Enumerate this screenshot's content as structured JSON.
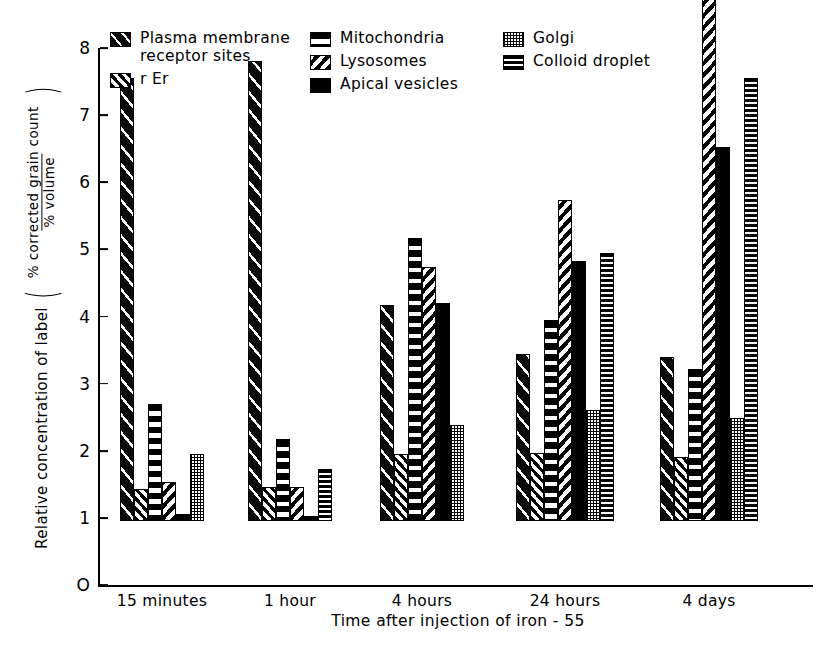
{
  "chart_data": {
    "type": "bar",
    "title": "",
    "xlabel": "Time  after  injection  of  iron - 55",
    "ylabel": "Relative  concentration  of  label",
    "ylabel_fraction": {
      "numerator": "% corrected  grain count",
      "denominator": "% volume"
    },
    "ylim": [
      0,
      8
    ],
    "yticks": [
      0,
      1,
      2,
      3,
      4,
      5,
      6,
      7,
      8
    ],
    "ytick_labels": [
      "O",
      "1",
      "2",
      "3",
      "4",
      "5",
      "6",
      "7",
      "8"
    ],
    "grid": false,
    "legend_position": "top",
    "categories": [
      "15 minutes",
      "1 hour",
      "4 hours",
      "24 hours",
      "4 days"
    ],
    "series": [
      {
        "name": "Plasma membrane receptor sites",
        "key": "plasma",
        "pattern": "diagonal-sparse-forward-on-black",
        "values": [
          6.6,
          6.85,
          3.22,
          2.49,
          2.45
        ]
      },
      {
        "name": "r Er",
        "key": "rer",
        "pattern": "diagonal-dense-forward",
        "values": [
          0.48,
          0.5,
          1.0,
          1.02,
          0.95
        ]
      },
      {
        "name": "Mitochondria",
        "key": "mito",
        "pattern": "horizontal-wide-stripes",
        "values": [
          1.75,
          1.22,
          4.22,
          2.99,
          2.27
        ]
      },
      {
        "name": "Lysosomes",
        "key": "lyso",
        "pattern": "diagonal-backslash",
        "values": [
          0.58,
          0.5,
          3.79,
          4.78,
          8.3
        ]
      },
      {
        "name": "Apical vesicles",
        "key": "apical",
        "pattern": "solid-black",
        "values": [
          0.1,
          0.08,
          3.25,
          3.87,
          5.57
        ]
      },
      {
        "name": "Golgi",
        "key": "golgi",
        "pattern": "fine-dotted",
        "values": [
          1.0,
          null,
          1.43,
          1.65,
          1.53
        ]
      },
      {
        "name": "Colloid droplet",
        "key": "colloid",
        "pattern": "horizontal-fine-stripes",
        "values": [
          null,
          0.78,
          null,
          4.0,
          6.6
        ]
      }
    ],
    "legend": [
      {
        "label": "Plasma membrane\nreceptor sites",
        "key": "plasma"
      },
      {
        "label": "r Er",
        "key": "rer"
      },
      {
        "label": "Mitochondria",
        "key": "mito"
      },
      {
        "label": "Lysosomes",
        "key": "lyso"
      },
      {
        "label": "Apical vesicles",
        "key": "apical"
      },
      {
        "label": "Golgi",
        "key": "golgi"
      },
      {
        "label": "Colloid droplet",
        "key": "colloid"
      }
    ],
    "colors": {
      "ink": "#000000",
      "background": "#ffffff"
    }
  }
}
